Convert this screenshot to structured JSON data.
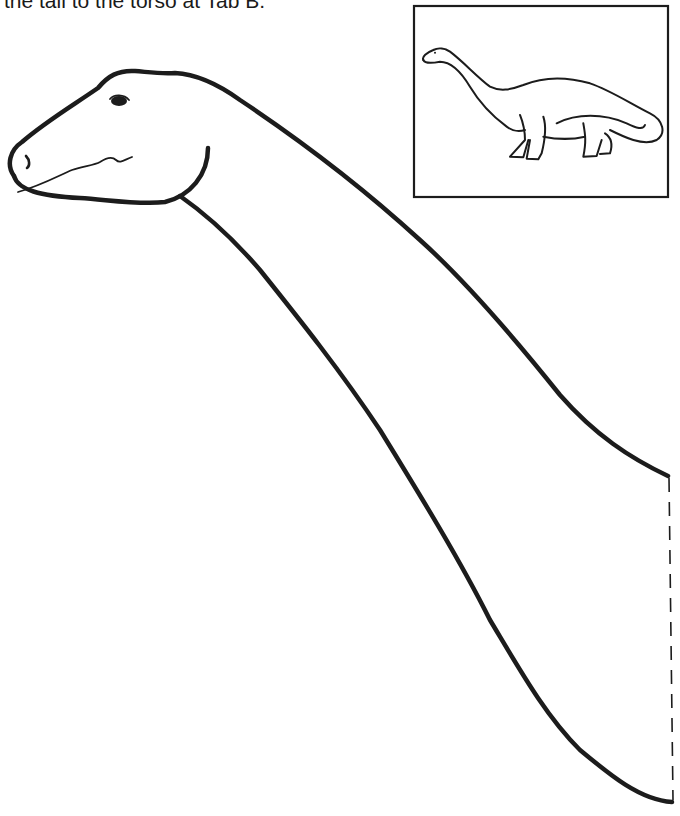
{
  "instruction": {
    "text": "the tail to the torso at Tab B."
  },
  "figure": {
    "parts": [
      "head",
      "neck",
      "tab-fold-line",
      "reference-thumbnail"
    ]
  }
}
